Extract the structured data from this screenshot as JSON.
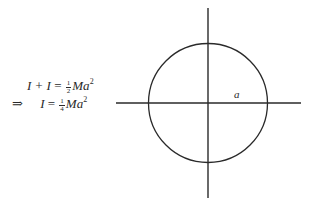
{
  "equations": [
    {
      "lhs": "I + I",
      "equals": "=",
      "frac_num": "1",
      "frac_den": "2",
      "rhs_var": "Ma",
      "exponent": "2"
    },
    {
      "prefix": "⇒",
      "lhs": "I",
      "equals": "=",
      "frac_num": "1",
      "frac_den": "4",
      "rhs_var": "Ma",
      "exponent": "2"
    }
  ],
  "figure": {
    "type": "circle-with-axes",
    "radius_label": "a",
    "stroke_color": "#2a2a2a",
    "center": [
      208,
      103
    ],
    "radius": 59,
    "vertical_axis": {
      "x": 208,
      "y1": 8,
      "y2": 198
    },
    "horizontal_axis": {
      "y": 103,
      "x1": 116,
      "x2": 301
    }
  }
}
